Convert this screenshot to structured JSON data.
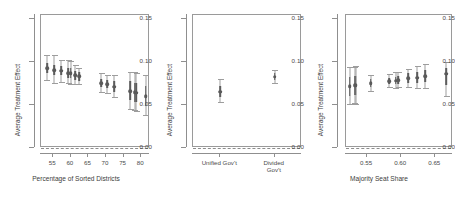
{
  "figure": {
    "type": "multi-panel-coefficient-plot",
    "panels": 3,
    "background": "#ffffff",
    "point_color": "#595959",
    "whisker_color": "#9d9d9d",
    "zero_line_color": "#8d8d8d"
  },
  "chart_data": [
    {
      "type": "scatter",
      "title": "",
      "xlabel": "Percentage of Sorted Districts",
      "ylabel": "Average Treatment Effect",
      "ylim": [
        0.0,
        0.155
      ],
      "xlim": [
        51.5,
        82.5
      ],
      "yticks": [
        0.0,
        0.05,
        0.1,
        0.15
      ],
      "ytick_labels": [
        "0.00",
        "0.05",
        "0.10",
        "0.15"
      ],
      "xticks": [
        55,
        60,
        65,
        70,
        75,
        80
      ],
      "xtick_labels": [
        "55",
        "60",
        "65",
        "70",
        "75",
        "80"
      ],
      "grid": false,
      "legend": "none",
      "annotations": [
        "dashed horizontal reference line at y = 0.00"
      ],
      "points": [
        {
          "x": 53.2,
          "y": 0.093,
          "lo": 0.1085,
          "hi": 0.0775,
          "inner_lo": 0.0985,
          "inner_hi": 0.0875
        },
        {
          "x": 55.3,
          "y": 0.091,
          "lo": 0.108,
          "hi": 0.0745,
          "inner_lo": 0.097,
          "inner_hi": 0.085
        },
        {
          "x": 57.3,
          "y": 0.09,
          "lo": 0.103,
          "hi": 0.076,
          "inner_lo": 0.0955,
          "inner_hi": 0.0845
        },
        {
          "x": 59.2,
          "y": 0.0875,
          "lo": 0.102,
          "hi": 0.074,
          "inner_lo": 0.0935,
          "inner_hi": 0.082
        },
        {
          "x": 59.9,
          "y": 0.087,
          "lo": 0.1015,
          "hi": 0.0735,
          "inner_lo": 0.093,
          "inner_hi": 0.0815
        },
        {
          "x": 61.2,
          "y": 0.0845,
          "lo": 0.0965,
          "hi": 0.073,
          "inner_lo": 0.09,
          "inner_hi": 0.079
        },
        {
          "x": 62.3,
          "y": 0.0835,
          "lo": 0.0935,
          "hi": 0.0735,
          "inner_lo": 0.0885,
          "inner_hi": 0.0785
        },
        {
          "x": 68.6,
          "y": 0.0755,
          "lo": 0.087,
          "hi": 0.0645,
          "inner_lo": 0.0805,
          "inner_hi": 0.0705
        },
        {
          "x": 70.3,
          "y": 0.0745,
          "lo": 0.0855,
          "hi": 0.0635,
          "inner_lo": 0.0795,
          "inner_hi": 0.0695
        },
        {
          "x": 72.3,
          "y": 0.0715,
          "lo": 0.085,
          "hi": 0.0585,
          "inner_lo": 0.0775,
          "inner_hi": 0.0655
        },
        {
          "x": 76.9,
          "y": 0.0665,
          "lo": 0.089,
          "hi": 0.044,
          "inner_lo": 0.0775,
          "inner_hi": 0.0555
        },
        {
          "x": 78.1,
          "y": 0.065,
          "lo": 0.088,
          "hi": 0.043,
          "inner_lo": 0.076,
          "inner_hi": 0.054
        },
        {
          "x": 78.6,
          "y": 0.0645,
          "lo": 0.0875,
          "hi": 0.0425,
          "inner_lo": 0.0755,
          "inner_hi": 0.0535
        },
        {
          "x": 81.3,
          "y": 0.0605,
          "lo": 0.0855,
          "hi": 0.0375,
          "inner_lo": 0.072,
          "inner_hi": 0.049
        }
      ]
    },
    {
      "type": "scatter",
      "title": "",
      "xlabel": "",
      "ylabel": "Average Treatment Effect",
      "ylim": [
        0.0,
        0.155
      ],
      "yticks": [
        0.0,
        0.05,
        0.1,
        0.15
      ],
      "ytick_labels": [
        "0.00",
        "0.05",
        "0.10",
        "0.15"
      ],
      "categories": [
        "Unified Gov't",
        "Divided Gov't"
      ],
      "grid": false,
      "legend": "none",
      "annotations": [
        "dashed horizontal reference line at y = 0.00"
      ],
      "points": [
        {
          "category": "Unified Gov't",
          "y": 0.0655,
          "lo": 0.08,
          "hi": 0.052,
          "inner_lo": 0.072,
          "inner_hi": 0.0595
        },
        {
          "category": "Divided Gov't",
          "y": 0.083,
          "lo": 0.0905,
          "hi": 0.0745,
          "inner_lo": 0.087,
          "inner_hi": 0.079
        }
      ]
    },
    {
      "type": "scatter",
      "title": "",
      "xlabel": "Majority Seat Share",
      "ylabel": "Average Treatment Effect",
      "ylim": [
        0.0,
        0.155
      ],
      "xlim": [
        0.519,
        0.676
      ],
      "yticks": [
        0.0,
        0.05,
        0.1,
        0.15
      ],
      "ytick_labels": [
        "0.00",
        "0.05",
        "0.10",
        "0.15"
      ],
      "xticks": [
        0.55,
        0.6,
        0.65
      ],
      "xtick_labels": [
        "0.55",
        "0.60",
        "0.65"
      ],
      "grid": false,
      "legend": "none",
      "annotations": [
        "dashed horizontal reference line at y = 0.00"
      ],
      "points": [
        {
          "x": 0.5245,
          "y": 0.072,
          "lo": 0.094,
          "hi": 0.05,
          "inner_lo": 0.083,
          "inner_hi": 0.061
        },
        {
          "x": 0.532,
          "y": 0.073,
          "lo": 0.0945,
          "hi": 0.051,
          "inner_lo": 0.084,
          "inner_hi": 0.062
        },
        {
          "x": 0.5335,
          "y": 0.073,
          "lo": 0.095,
          "hi": 0.0505,
          "inner_lo": 0.084,
          "inner_hi": 0.062
        },
        {
          "x": 0.5555,
          "y": 0.0755,
          "lo": 0.0855,
          "hi": 0.0655,
          "inner_lo": 0.0805,
          "inner_hi": 0.0705
        },
        {
          "x": 0.5825,
          "y": 0.078,
          "lo": 0.0865,
          "hi": 0.07,
          "inner_lo": 0.082,
          "inner_hi": 0.074
        },
        {
          "x": 0.592,
          "y": 0.0785,
          "lo": 0.088,
          "hi": 0.069,
          "inner_lo": 0.083,
          "inner_hi": 0.074
        },
        {
          "x": 0.5955,
          "y": 0.079,
          "lo": 0.0885,
          "hi": 0.0695,
          "inner_lo": 0.0835,
          "inner_hi": 0.0745
        },
        {
          "x": 0.6105,
          "y": 0.0815,
          "lo": 0.0925,
          "hi": 0.0705,
          "inner_lo": 0.087,
          "inner_hi": 0.076
        },
        {
          "x": 0.6235,
          "y": 0.082,
          "lo": 0.095,
          "hi": 0.069,
          "inner_lo": 0.0885,
          "inner_hi": 0.0755
        },
        {
          "x": 0.635,
          "y": 0.0835,
          "lo": 0.098,
          "hi": 0.069,
          "inner_lo": 0.0905,
          "inner_hi": 0.0765
        },
        {
          "x": 0.666,
          "y": 0.0865,
          "lo": 0.1,
          "hi": 0.06,
          "inner_lo": 0.0935,
          "inner_hi": 0.073
        }
      ]
    }
  ]
}
